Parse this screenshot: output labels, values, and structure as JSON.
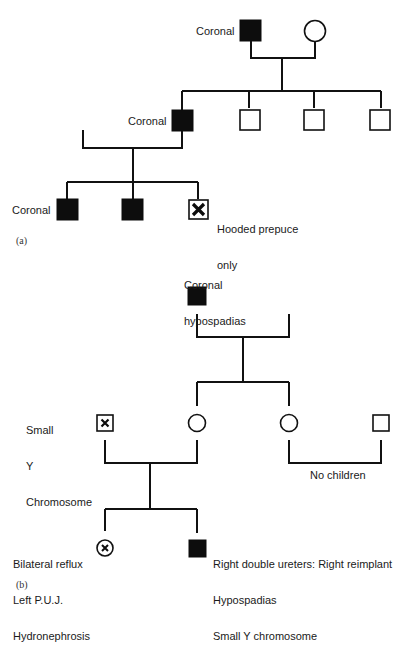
{
  "figure": {
    "panel_a": {
      "label": "(a)",
      "individuals": {
        "gen1_father_label": "Coronal",
        "gen2_son_label": "Coronal",
        "gen3_son1_label": "Coronal",
        "gen3_son3_label_line1": "Hooded prepuce",
        "gen3_son3_label_line2": "only"
      }
    },
    "panel_b": {
      "label": "(b)",
      "individuals": {
        "gen1_father_label_line1": "Coronal",
        "gen1_father_label_line2": "hypospadias",
        "gen2_husband_label_line1": "Small",
        "gen2_husband_label_line2": "Y",
        "gen2_husband_label_line3": "Chromosome",
        "gen2_couple2_note": "No children",
        "gen3_daughter_label_line1": "Bilateral reflux",
        "gen3_daughter_label_line2": "Left P.U.J.",
        "gen3_daughter_label_line3": "Hydronephrosis",
        "gen3_son_label_line1": "Right double ureters: Right reimplant",
        "gen3_son_label_line2": "Hypospadias",
        "gen3_son_label_line3": "Small Y chromosome"
      }
    },
    "legend_symbols": {
      "filled_square": "affected male",
      "open_square": "unaffected male",
      "open_circle": "unaffected female",
      "square_with_x": "male with other anomaly",
      "circle_with_x": "female with other anomaly"
    },
    "colors": {
      "ink": "#111111",
      "background": "#ffffff"
    }
  }
}
